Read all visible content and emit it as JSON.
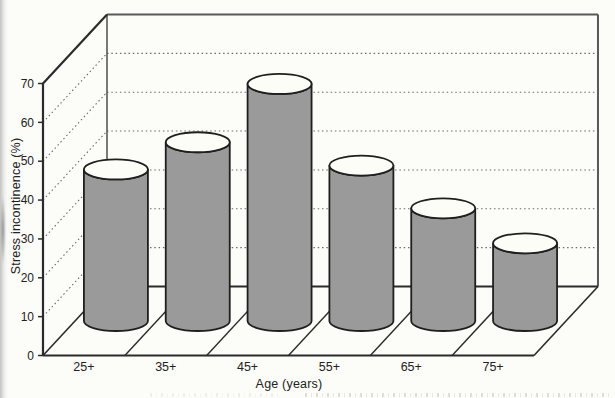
{
  "chart_data": {
    "type": "bar",
    "style": "3d-cylinder",
    "categories": [
      "25+",
      "35+",
      "45+",
      "55+",
      "65+",
      "75+"
    ],
    "values": [
      39,
      46,
      61,
      40,
      29,
      20
    ],
    "xlabel": "Age (years)",
    "ylabel": "Stress incontinence (%)",
    "ylim": [
      0,
      70
    ],
    "yticks": [
      0,
      10,
      20,
      30,
      40,
      50,
      60,
      70
    ],
    "grid": "dotted-horizontal-back-and-left-wall",
    "legend": "none",
    "colors": {
      "cylinder_body": "#9a9a9a",
      "cylinder_top": "#fdfdf8",
      "outline": "#1f1f1f",
      "axis": "#2b2b2b",
      "frame": "#595959",
      "gridline": "#6b6b6b",
      "text": "#222222",
      "background": "#fcfcf9"
    }
  }
}
